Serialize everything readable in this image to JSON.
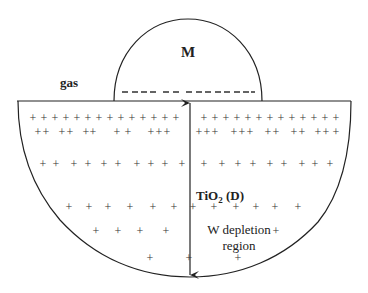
{
  "diagram": {
    "type": "schematic cross-section",
    "labels": {
      "metal": "M",
      "ambient": "gas",
      "semiconductor": "TiO",
      "semiconductor_sub": "2",
      "semiconductor_suffix": " (D)",
      "region_line1": "W depletion",
      "region_line2": "region"
    },
    "colors": {
      "stroke": "#222222",
      "background": "#ffffff"
    },
    "plus_rows": [
      {
        "y": 118,
        "left": [
          33,
          44,
          55,
          66,
          77,
          88,
          99,
          110,
          121,
          132,
          143,
          154,
          165,
          176
        ],
        "right": [
          204,
          215,
          226,
          237,
          248,
          259,
          270,
          281,
          292,
          303,
          314,
          325,
          336
        ]
      },
      {
        "y": 132,
        "left": [
          38,
          46,
          62,
          70,
          86,
          93,
          117,
          128,
          151,
          159,
          167
        ],
        "right": [
          199,
          207,
          215,
          234,
          242,
          250,
          268,
          276,
          294,
          302,
          318,
          326,
          336
        ]
      },
      {
        "y": 164,
        "left": [
          43,
          56,
          74,
          88,
          104,
          118,
          137,
          151,
          165,
          182
        ],
        "right": [
          204,
          222,
          238,
          253,
          270,
          284,
          302,
          315,
          330
        ]
      },
      {
        "y": 207,
        "left": [
          69,
          89,
          108,
          130,
          153,
          174
        ],
        "right": [
          193,
          214,
          236,
          256,
          275,
          298
        ]
      },
      {
        "y": 231,
        "left": [
          96,
          118,
          140,
          166
        ],
        "right": [
          276
        ]
      },
      {
        "y": 258,
        "left": [
          150
        ],
        "right": [
          189,
          238
        ]
      }
    ],
    "dash_segments": [
      [
        122,
        128
      ],
      [
        132,
        138
      ],
      [
        141,
        147
      ],
      [
        150,
        156
      ],
      [
        163,
        169
      ],
      [
        173,
        179
      ],
      [
        186,
        192
      ],
      [
        196,
        202
      ],
      [
        205,
        211
      ],
      [
        215,
        221
      ],
      [
        224,
        230
      ],
      [
        234,
        240
      ],
      [
        243,
        249
      ],
      [
        251,
        255
      ]
    ]
  }
}
